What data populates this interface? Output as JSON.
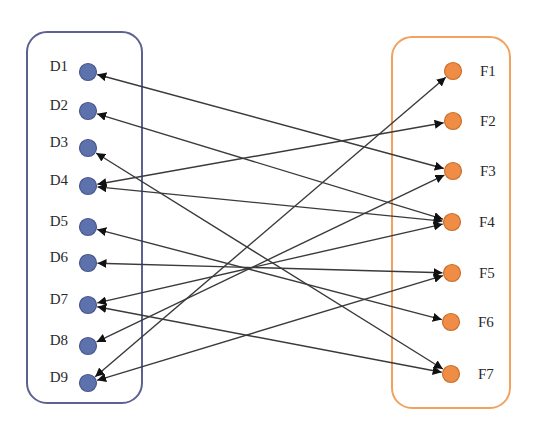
{
  "diagram": {
    "title": "",
    "colors": {
      "left_group_border": "#5c6190",
      "right_group_border": "#f0a25e",
      "left_node_fill": "#5d72ad",
      "left_node_stroke": "#48588c",
      "right_node_fill": "#ef8c45",
      "right_node_stroke": "#c9702c",
      "edge": "#3a3a3a"
    },
    "groups": [
      {
        "id": "D",
        "x": 27,
        "y": 32,
        "w": 115,
        "h": 371,
        "r": 20,
        "color_key": "left_group_border"
      },
      {
        "id": "F",
        "x": 392,
        "y": 37,
        "w": 118,
        "h": 371,
        "r": 20,
        "color_key": "right_group_border"
      }
    ],
    "left_nodes": [
      {
        "id": "D1",
        "label": "D1",
        "x": 88,
        "y": 72
      },
      {
        "id": "D2",
        "label": "D2",
        "x": 88,
        "y": 111
      },
      {
        "id": "D3",
        "label": "D3",
        "x": 88,
        "y": 148
      },
      {
        "id": "D4",
        "label": "D4",
        "x": 88,
        "y": 186
      },
      {
        "id": "D5",
        "label": "D5",
        "x": 88,
        "y": 227
      },
      {
        "id": "D6",
        "label": "D6",
        "x": 88,
        "y": 263
      },
      {
        "id": "D7",
        "label": "D7",
        "x": 88,
        "y": 305
      },
      {
        "id": "D8",
        "label": "D8",
        "x": 88,
        "y": 346
      },
      {
        "id": "D9",
        "label": "D9",
        "x": 88,
        "y": 383
      }
    ],
    "right_nodes": [
      {
        "id": "F1",
        "label": "F1",
        "x": 453,
        "y": 71
      },
      {
        "id": "F2",
        "label": "F2",
        "x": 453,
        "y": 121
      },
      {
        "id": "F3",
        "label": "F3",
        "x": 453,
        "y": 171
      },
      {
        "id": "F4",
        "label": "F4",
        "x": 452,
        "y": 222
      },
      {
        "id": "F5",
        "label": "F5",
        "x": 452,
        "y": 273
      },
      {
        "id": "F6",
        "label": "F6",
        "x": 451,
        "y": 322
      },
      {
        "id": "F7",
        "label": "F7",
        "x": 451,
        "y": 374
      }
    ],
    "edges": [
      {
        "from": "D1",
        "to": "F3",
        "bidirectional": true
      },
      {
        "from": "D2",
        "to": "F4",
        "bidirectional": true
      },
      {
        "from": "D3",
        "to": "F7",
        "bidirectional": true
      },
      {
        "from": "D4",
        "to": "F2",
        "bidirectional": true
      },
      {
        "from": "D4",
        "to": "F4",
        "bidirectional": true
      },
      {
        "from": "D5",
        "to": "F6",
        "bidirectional": true
      },
      {
        "from": "D6",
        "to": "F5",
        "bidirectional": true
      },
      {
        "from": "D7",
        "to": "F4",
        "bidirectional": true
      },
      {
        "from": "D7",
        "to": "F7",
        "bidirectional": true
      },
      {
        "from": "D8",
        "to": "F3",
        "bidirectional": true
      },
      {
        "from": "D9",
        "to": "F1",
        "bidirectional": true
      },
      {
        "from": "D9",
        "to": "F5",
        "bidirectional": true
      }
    ]
  }
}
